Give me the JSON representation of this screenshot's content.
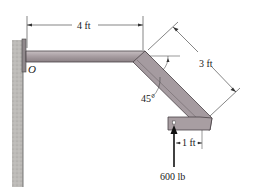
{
  "diagram": {
    "type": "engineering-statics-figure",
    "labels": {
      "horizontal_length": "4 ft",
      "diagonal_length": "3 ft",
      "angle": "45°",
      "offset": "1 ft",
      "force": "600 lb",
      "origin": "O"
    },
    "colors": {
      "member_fill": "#a89ea2",
      "member_edge": "#4a4346",
      "wall_fill": "#b9b7b4",
      "dimension_line": "#333333",
      "force_arrow": "#111111"
    }
  }
}
